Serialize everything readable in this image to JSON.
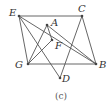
{
  "figure": {
    "caption": "(c)",
    "points": {
      "E": {
        "label": "E",
        "x": 19,
        "y": 16,
        "lx": 9,
        "ly": 16
      },
      "C": {
        "label": "C",
        "x": 82,
        "y": 16,
        "lx": 78,
        "ly": 12
      },
      "A": {
        "label": "A",
        "x": 47,
        "y": 25,
        "lx": 51,
        "ly": 26
      },
      "F": {
        "label": "F",
        "x": 52,
        "y": 40,
        "lx": 55,
        "ly": 49
      },
      "G": {
        "label": "G",
        "x": 28,
        "y": 64,
        "lx": 15,
        "ly": 68
      },
      "B": {
        "label": "B",
        "x": 96,
        "y": 64,
        "lx": 99,
        "ly": 68
      },
      "D": {
        "label": "D",
        "x": 60,
        "y": 78,
        "lx": 62,
        "ly": 82
      }
    },
    "edges": [
      [
        "E",
        "C"
      ],
      [
        "C",
        "B"
      ],
      [
        "B",
        "G"
      ],
      [
        "G",
        "E"
      ],
      [
        "E",
        "B"
      ],
      [
        "E",
        "D"
      ],
      [
        "C",
        "D"
      ],
      [
        "G",
        "A"
      ],
      [
        "G",
        "F"
      ],
      [
        "A",
        "F"
      ],
      [
        "A",
        "B"
      ]
    ]
  }
}
